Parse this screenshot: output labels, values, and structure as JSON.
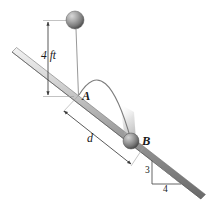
{
  "figure": {
    "type": "physics-diagram",
    "background_color": "#ffffff"
  },
  "labels": {
    "height_dimension": "4 ft",
    "point_a": "A",
    "point_b": "B",
    "distance_dimension": "d",
    "slope_rise": "3",
    "slope_run": "4"
  },
  "geometry": {
    "incline": {
      "start": [
        12,
        52
      ],
      "end": [
        201,
        199
      ],
      "thickness_px": 6,
      "slope_rise": 3,
      "slope_run": 4
    },
    "ball_top": {
      "cx": 75,
      "cy": 20,
      "r": 9
    },
    "point_a": {
      "x": 78,
      "y": 96
    },
    "ball_b": {
      "cx": 131,
      "cy": 141,
      "r": 8
    },
    "trajectory_apex": {
      "x": 106,
      "y": 72
    },
    "height_dimension_line": {
      "x": 48,
      "y_top": 20,
      "y_bottom": 97
    },
    "distance_dimension_line": {
      "start": [
        62,
        110
      ],
      "end": [
        133,
        166
      ]
    },
    "slope_triangle": {
      "top": [
        152,
        160
      ],
      "corner": [
        152,
        184
      ],
      "right": [
        181,
        184
      ]
    }
  },
  "colors": {
    "line": "#4a4a4a",
    "incline_light": "#e8e8e8",
    "incline_mid": "#9a9a9a",
    "incline_dark": "#5e5e5e",
    "ball_light": "#cfcfcf",
    "ball_mid": "#9d9d9d",
    "ball_dark": "#5a5a5a",
    "text": "#1a1a1a",
    "trajectory": "#7d7d7d",
    "blur": "#bdbdbd"
  }
}
